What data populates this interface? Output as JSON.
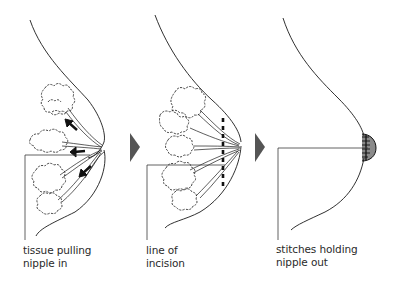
{
  "diagram": {
    "panels": [
      {
        "id": "before",
        "label_lines": [
          "tissue pulling",
          "nipple in"
        ],
        "features": [
          "breast-outline",
          "glandular-tissue-lobules",
          "milk-ducts",
          "inward-pull-arrows"
        ]
      },
      {
        "id": "incision",
        "label_lines": [
          "line of",
          "incision"
        ],
        "features": [
          "breast-outline",
          "glandular-tissue-lobules",
          "milk-ducts",
          "dashed-incision-line"
        ]
      },
      {
        "id": "after",
        "label_lines": [
          "stitches holding",
          "nipple out"
        ],
        "features": [
          "breast-outline",
          "everted-nipple",
          "stitches",
          "stippled-areola"
        ]
      }
    ],
    "step_arrows": [
      {
        "from": "before",
        "to": "incision",
        "color": "#555555"
      },
      {
        "from": "incision",
        "to": "after",
        "color": "#555555"
      }
    ],
    "colors": {
      "line": "#1a1a1a",
      "leader_line": "#3a3a3a",
      "arrow": "#555555",
      "text": "#2a2a2a",
      "background": "#ffffff"
    }
  }
}
